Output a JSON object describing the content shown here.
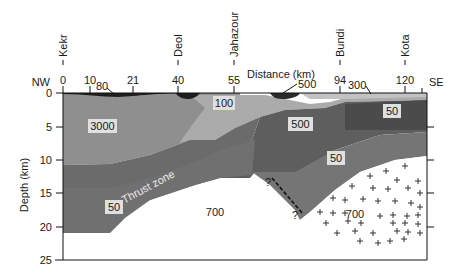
{
  "axes": {
    "x_title": "Distance (km)",
    "y_title": "Depth (km)",
    "left_end": "NW",
    "right_end": "SE",
    "x_ticks": [
      "0",
      "10",
      "21",
      "40",
      "55",
      "94",
      "120"
    ],
    "y_ticks": [
      "0",
      "5",
      "10",
      "15",
      "20",
      "25"
    ]
  },
  "towns": [
    {
      "name": "Kekr",
      "km": "0"
    },
    {
      "name": "Deol",
      "km": "40"
    },
    {
      "name": "Jahazour",
      "km": "55"
    },
    {
      "name": "Bundi",
      "km": "94"
    },
    {
      "name": "Kota",
      "km": "120"
    }
  ],
  "layers": {
    "surface_left": "80",
    "surface_mid": "500",
    "surface_right": "300",
    "upper_left": "3000",
    "upper_mid": "100",
    "middle": "500",
    "upper_right": "50",
    "deep_right": "50",
    "deep_left": "50",
    "basement_left": "700",
    "basement_right": "700"
  },
  "annotations": {
    "thrust_zone": "Thrust zone",
    "fault_top_q": "?",
    "fault_bottom_q": "?"
  },
  "colors": {
    "sediment_black": "#1e1e1e",
    "layer_3000": "#8f8f8f",
    "layer_100": "#a9a9a9",
    "layer_500": "#5c5c5c",
    "layer_50_upper": "#4a4a4a",
    "layer_50_deep": "#747474",
    "thrust_zone": "#6a6a6a",
    "surface_light": "#c2c2c2",
    "basement": "#ffffff"
  }
}
